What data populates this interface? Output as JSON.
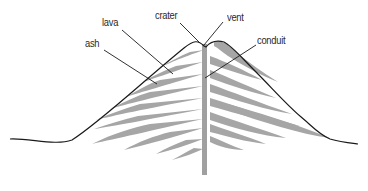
{
  "diagram": {
    "labels": {
      "crater": "crater",
      "vent": "vent",
      "lava": "lava",
      "ash": "ash",
      "conduit": "conduit"
    },
    "colors": {
      "outline": "#1a1a1a",
      "layer": "#a6a6a6",
      "conduit": "#a0a0a0",
      "leader": "#1a1a1a",
      "text": "#2a2a2a",
      "background": "#ffffff"
    }
  }
}
